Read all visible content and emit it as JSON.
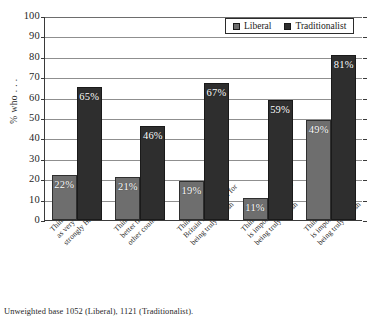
{
  "chart_data": {
    "type": "bar",
    "title": "",
    "xlabel": "",
    "ylabel": "% who . . .",
    "ylim": [
      0,
      100
    ],
    "ytick_step": 10,
    "yticks": [
      100,
      90,
      80,
      70,
      60,
      50,
      40,
      30,
      20,
      10,
      0
    ],
    "grid": true,
    "legend_position": "top-right",
    "categories": [
      "Think of self as very strongly British",
      "Think Britain is better than other countries",
      "Think Being born in Britain is important for being truly British",
      "Think British ancestry is important for being truly British",
      "Think Feeling British is important to being truly British"
    ],
    "category_lines": [
      [
        "Think of self",
        "as very",
        "strongly British"
      ],
      [
        "Think Britain is",
        "better than",
        "other countries"
      ],
      [
        "Think Being born in",
        "Britain is important for",
        "being truly British"
      ],
      [
        "Think British ancestry",
        "is important for",
        "being truly British"
      ],
      [
        "Think Feeling British",
        "is important to",
        "being truly British"
      ]
    ],
    "series": [
      {
        "name": "Liberal",
        "color": "#6e6e6e",
        "values": [
          22,
          21,
          19,
          11,
          49
        ],
        "labels": [
          "22%",
          "21%",
          "19%",
          "11%",
          "49%"
        ]
      },
      {
        "name": "Traditionalist",
        "color": "#2e2e2e",
        "values": [
          65,
          46,
          67,
          59,
          81
        ],
        "labels": [
          "65%",
          "46%",
          "67%",
          "59%",
          "81%"
        ]
      }
    ],
    "footnote": "Unweighted base 1052 (Liberal), 1121 (Traditionalist)."
  },
  "legend": {
    "items": [
      {
        "label": "Liberal",
        "color": "#6e6e6e"
      },
      {
        "label": "Traditionalist",
        "color": "#2e2e2e"
      }
    ]
  },
  "axis": {
    "y_title": "% who . . .",
    "y_tick_labels": [
      "100",
      "90",
      "80",
      "70",
      "60",
      "50",
      "40",
      "30",
      "20",
      "10",
      "0"
    ]
  },
  "footnote": {
    "text": "Unweighted base 1052 (Liberal), 1121 (Traditionalist)."
  }
}
